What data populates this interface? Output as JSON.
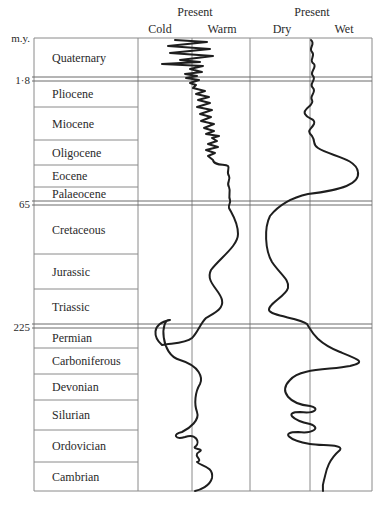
{
  "chart_data": {
    "type": "line",
    "y_axis": {
      "label": "m.y.",
      "ticks": [
        {
          "label": "1·8",
          "value": 1.8
        },
        {
          "label": "65",
          "value": 65
        },
        {
          "label": "225",
          "value": 225
        }
      ],
      "direction": "time increases downward"
    },
    "periods": [
      {
        "name": "Quaternary",
        "era": "Cenozoic"
      },
      {
        "name": "Pliocene",
        "era": "Cenozoic"
      },
      {
        "name": "Miocene",
        "era": "Cenozoic"
      },
      {
        "name": "Oligocene",
        "era": "Cenozoic"
      },
      {
        "name": "Eocene",
        "era": "Cenozoic"
      },
      {
        "name": "Palaeocene",
        "era": "Cenozoic"
      },
      {
        "name": "Cretaceous",
        "era": "Mesozoic"
      },
      {
        "name": "Jurassic",
        "era": "Mesozoic"
      },
      {
        "name": "Triassic",
        "era": "Mesozoic"
      },
      {
        "name": "Permian",
        "era": "Palaeozoic"
      },
      {
        "name": "Carboniferous",
        "era": "Palaeozoic"
      },
      {
        "name": "Devonian",
        "era": "Palaeozoic"
      },
      {
        "name": "Silurian",
        "era": "Palaeozoic"
      },
      {
        "name": "Ordovician",
        "era": "Palaeozoic"
      },
      {
        "name": "Cambrian",
        "era": "Palaeozoic"
      }
    ],
    "panels": [
      {
        "name": "Temperature",
        "header": "Present",
        "left_label": "Cold",
        "right_label": "Warm",
        "series_description": "relative to present (0 = present, -1 cold, +1 warm)",
        "values_by_period": {
          "Quaternary": -0.6,
          "Pliocene": 0.1,
          "Miocene": 0.4,
          "Oligocene": 0.5,
          "Eocene": 0.8,
          "Palaeocene": 0.8,
          "Cretaceous": 0.9,
          "Jurassic": 0.5,
          "Triassic": 0.6,
          "Permian": -0.9,
          "Carboniferous": 0.6,
          "Devonian": 0.3,
          "Silurian": -0.5,
          "Ordovician": 0.6,
          "Cambrian": 0.2
        }
      },
      {
        "name": "Moisture",
        "header": "Present",
        "left_label": "Dry",
        "right_label": "Wet",
        "series_description": "relative to present (0 = present, -1 dry, +1 wet)",
        "values_by_period": {
          "Quaternary": 0.0,
          "Pliocene": -0.1,
          "Miocene": 0.0,
          "Oligocene": 0.6,
          "Eocene": 0.9,
          "Palaeocene": 0.2,
          "Cretaceous": -0.8,
          "Jurassic": -0.4,
          "Triassic": -0.7,
          "Permian": 0.2,
          "Carboniferous": 0.9,
          "Devonian": -0.5,
          "Silurian": -0.3,
          "Ordovician": 0.5,
          "Cambrian": 0.3
        }
      }
    ],
    "grid": true,
    "legend": null
  },
  "labels": {
    "my": "m.y.",
    "tick_1_8": "1·8",
    "tick_65": "65",
    "tick_225": "225",
    "temp_present": "Present",
    "temp_cold": "Cold",
    "temp_warm": "Warm",
    "moist_present": "Present",
    "moist_dry": "Dry",
    "moist_wet": "Wet"
  },
  "layout": {
    "table_left": 34,
    "col_divider": 138,
    "panel_divider": 250,
    "right": 372,
    "top": 38,
    "bottom": 491,
    "temp_present_x": 192,
    "moist_present_x": 310,
    "period_bounds": [
      38,
      79,
      107,
      140,
      165,
      187,
      203,
      254,
      289,
      326,
      348,
      374,
      400,
      430,
      462,
      491
    ],
    "double_lines": [
      [
        77,
        81
      ],
      [
        201,
        205
      ],
      [
        324,
        328
      ]
    ]
  },
  "paths": {
    "temperature": "M175,40 L207,42 L168,46 L210,49 L170,53 L213,56 L180,60 L200,62 L162,64 L203,66 L190,69 L202,72 L185,74 L197,76 L186,78 L199,80 L190,83 L196,85 L193,88 L205,91 L196,94 L209,97 L198,100 L210,103 L197,107 L212,110 L200,114 L211,117 L201,121 L214,124 L204,128 L214,131 L206,134 L219,136 L212,138 L217,141 L208,144 L218,147 L206,150 L215,153 L208,156 L213,160 C214,166 225,164 228,166 C230,168 226,172 229,176 C231,180 226,183 229,187 C231,192 228,196 230,200 C231,203 228,205 229,208 C232,214 238,222 238,234 C238,246 220,258 211,270 C205,282 220,290 222,300 C224,310 212,314 206,318 C200,324 198,332 192,338 C185,344 170,343 162,345 C154,338 150,324 170,320 C160,318 160,355 180,360 C200,366 203,378 200,384 C195,392 194,404 197,412 C200,420 190,428 182,432 C172,434 175,440 185,437 C196,433 200,442 196,446 C190,450 206,448 199,452 C192,456 204,460 197,462 C200,466 214,466 212,478 C210,486 200,490 195,491",
    "moisture": "M311,40 C316,44 308,48 312,52 C316,56 308,60 314,64 C317,68 309,72 313,76 C317,80 308,84 313,88 C317,92 309,96 312,100 C315,106 302,108 305,114 C308,120 316,118 314,124 C311,130 306,130 312,136 C316,142 312,144 318,148 C330,156 356,158 358,172 C360,184 342,190 308,194 C290,198 278,206 270,216 C264,228 265,250 272,262 C280,274 290,280 288,288 C286,296 268,304 269,310 C270,316 300,318 307,324 C312,332 316,342 340,352 C360,360 366,362 350,366 C330,370 300,368 290,380 C278,392 290,404 310,406 C320,408 316,414 300,412 C284,412 292,420 310,424 C322,428 312,434 298,432 C280,432 288,440 310,444 C322,446 344,444 340,450 C326,462 326,474 324,480 C322,486 323,490 323,491"
  }
}
